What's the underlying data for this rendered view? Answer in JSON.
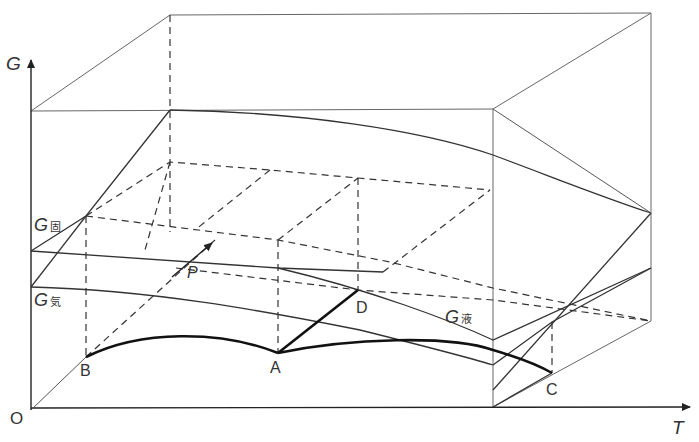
{
  "diagram": {
    "type": "3d-gibbs-free-energy-surfaces",
    "axes": {
      "vertical": "G",
      "horizontal": "T",
      "origin": "O"
    },
    "surfaces": [
      {
        "label": "G",
        "subscript": "固",
        "meaning": "solid"
      },
      {
        "label": "G",
        "subscript": "気",
        "meaning": "gas"
      },
      {
        "label": "G",
        "subscript": "液",
        "meaning": "liquid"
      }
    ],
    "points": [
      "A",
      "B",
      "C",
      "D"
    ],
    "pressure_axis_label": "P",
    "colors": {
      "line": "#333333",
      "thin_line": "#555555",
      "background": "#ffffff"
    }
  }
}
